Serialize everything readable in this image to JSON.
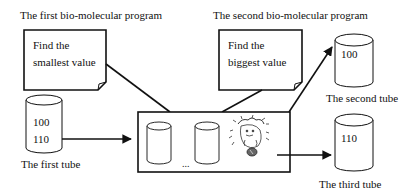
{
  "programs": [
    {
      "title": "The first bio-molecular program",
      "note_line1": "Find the",
      "note_line2": "smallest value"
    },
    {
      "title": "The second bio-molecular program",
      "note_line1": "Find the",
      "note_line2": "biggest value"
    }
  ],
  "tubes": {
    "first": {
      "label": "The first tube",
      "values": [
        "100",
        "110"
      ]
    },
    "second": {
      "label": "The second tube",
      "values": [
        "100"
      ]
    },
    "third": {
      "label": "The third tube",
      "values": [
        "110"
      ]
    }
  },
  "process_box": {
    "ellipsis": "...",
    "icon": "cartoon-creature-with-coin"
  },
  "colors": {
    "stroke": "#111111",
    "background": "#ffffff"
  }
}
